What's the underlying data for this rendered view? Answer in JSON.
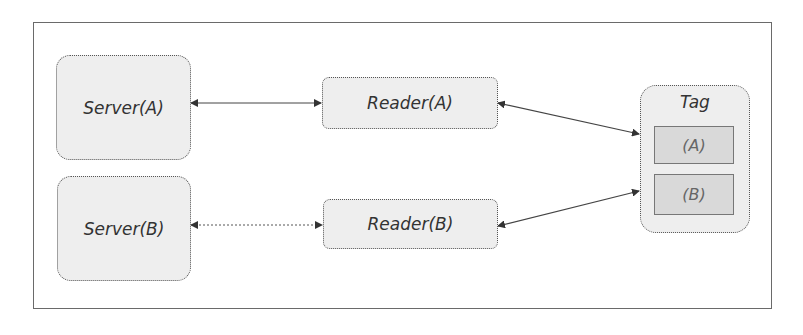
{
  "diagram": {
    "servers": [
      {
        "id": "server-a",
        "label": "Server(A)"
      },
      {
        "id": "server-b",
        "label": "Server(B)"
      }
    ],
    "readers": [
      {
        "id": "reader-a",
        "label": "Reader(A)"
      },
      {
        "id": "reader-b",
        "label": "Reader(B)"
      }
    ],
    "tag": {
      "label": "Tag",
      "slots": [
        {
          "id": "slot-a",
          "label": "(A)"
        },
        {
          "id": "slot-b",
          "label": "(B)"
        }
      ]
    },
    "connections": [
      {
        "from": "Server(A)",
        "to": "Reader(A)",
        "style": "solid",
        "direction": "bidirectional"
      },
      {
        "from": "Server(B)",
        "to": "Reader(B)",
        "style": "dotted",
        "direction": "bidirectional"
      },
      {
        "from": "Reader(A)",
        "to": "Tag",
        "style": "solid",
        "direction": "bidirectional"
      },
      {
        "from": "Reader(B)",
        "to": "Tag",
        "style": "solid",
        "direction": "bidirectional"
      }
    ],
    "colors": {
      "node_fill": "#eeeeee",
      "slot_fill": "#d9d9d9",
      "border": "#555555",
      "text": "#333333"
    }
  }
}
